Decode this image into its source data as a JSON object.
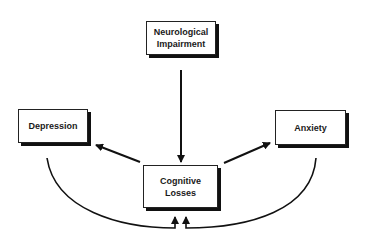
{
  "diagram": {
    "nodes": {
      "neurological": {
        "label_line1": "Neurological",
        "label_line2": "Impairment"
      },
      "depression": {
        "label": "Depression"
      },
      "anxiety": {
        "label": "Anxiety"
      },
      "cognitive": {
        "label_line1": "Cognitive",
        "label_line2": "Losses"
      }
    },
    "edges": [
      {
        "from": "Neurological Impairment",
        "to": "Cognitive Losses"
      },
      {
        "from": "Cognitive Losses",
        "to": "Depression"
      },
      {
        "from": "Cognitive Losses",
        "to": "Anxiety"
      },
      {
        "from": "Depression",
        "to": "Cognitive Losses"
      },
      {
        "from": "Anxiety",
        "to": "Cognitive Losses"
      }
    ],
    "colors": {
      "line": "#111111",
      "box_border": "#222222",
      "background": "#ffffff"
    }
  }
}
